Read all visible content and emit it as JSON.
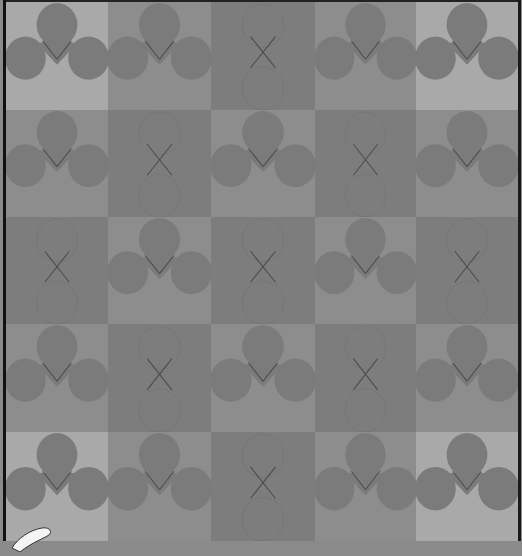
{
  "board": {
    "rows": 5,
    "cols": 5,
    "colors": {
      "light": "#a9a9a9",
      "mid": "#8d8d8d",
      "dark": "#7d7d7d",
      "lobe": "#7b7b7b",
      "line": "#4a4a4a",
      "border": "#111111"
    },
    "col_edges": [
      0,
      102,
      205,
      309,
      410,
      512
    ],
    "row_edges": [
      0,
      108,
      215,
      322,
      430,
      539
    ],
    "tiles": [
      [
        {
          "type": "trefoil",
          "bg": "light"
        },
        {
          "type": "trefoil",
          "bg": "mid"
        },
        {
          "type": "cross",
          "bg": "dark"
        },
        {
          "type": "trefoil",
          "bg": "mid"
        },
        {
          "type": "trefoil",
          "bg": "light"
        }
      ],
      [
        {
          "type": "trefoil",
          "bg": "mid"
        },
        {
          "type": "cross",
          "bg": "dark"
        },
        {
          "type": "trefoil",
          "bg": "mid"
        },
        {
          "type": "cross",
          "bg": "dark"
        },
        {
          "type": "trefoil",
          "bg": "mid"
        }
      ],
      [
        {
          "type": "cross",
          "bg": "dark"
        },
        {
          "type": "trefoil",
          "bg": "mid"
        },
        {
          "type": "cross",
          "bg": "dark"
        },
        {
          "type": "trefoil",
          "bg": "mid"
        },
        {
          "type": "cross",
          "bg": "dark"
        }
      ],
      [
        {
          "type": "trefoil",
          "bg": "mid"
        },
        {
          "type": "cross",
          "bg": "dark"
        },
        {
          "type": "trefoil",
          "bg": "mid"
        },
        {
          "type": "cross",
          "bg": "dark"
        },
        {
          "type": "trefoil",
          "bg": "mid"
        }
      ],
      [
        {
          "type": "trefoil",
          "bg": "light"
        },
        {
          "type": "trefoil",
          "bg": "mid"
        },
        {
          "type": "cross",
          "bg": "dark"
        },
        {
          "type": "trefoil",
          "bg": "mid"
        },
        {
          "type": "trefoil",
          "bg": "light"
        }
      ]
    ]
  },
  "overlay": {
    "icon": "white-hand-pointer-icon",
    "position": "bottom-left"
  }
}
